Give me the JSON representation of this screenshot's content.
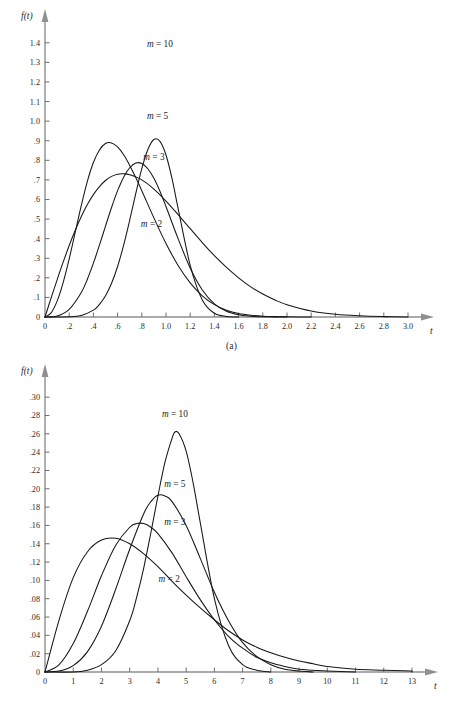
{
  "figure": {
    "panels": [
      {
        "id": "a",
        "caption": "(a)",
        "y_axis_title": "f(t)",
        "x_axis_title": "t",
        "x_ticks": [
          "0",
          ".2",
          ".4",
          ".6",
          ".8",
          "1.0",
          "1.2",
          "1.4",
          "1.6",
          "1.8",
          "2.0",
          "2.2",
          "2.4",
          "2.6",
          "2.8",
          "3.0"
        ],
        "y_ticks": [
          "0",
          ".1",
          ".2",
          ".3",
          ".4",
          ".5",
          ".6",
          ".7",
          ".8",
          ".9",
          "1.0",
          "1.1",
          "1.2",
          "1.3",
          "1.4"
        ],
        "series_labels": [
          "m = 10",
          "m = 5",
          "m = 3",
          "m = 2"
        ]
      },
      {
        "id": "b",
        "caption": "(b)",
        "y_axis_title": "f(t)",
        "x_axis_title": "t",
        "x_ticks": [
          "0",
          "1",
          "2",
          "3",
          "4",
          "5",
          "6",
          "7",
          "8",
          "9",
          "10",
          "11",
          "12",
          "13"
        ],
        "y_ticks": [
          "0",
          ".02",
          ".04",
          ".06",
          ".08",
          ".10",
          ".12",
          ".14",
          ".16",
          ".18",
          ".20",
          ".22",
          ".24",
          ".26",
          ".28",
          ".30"
        ],
        "series_labels": [
          "m = 10",
          "m = 5",
          "m = 3",
          "m = 2"
        ]
      }
    ]
  },
  "chart_data": [
    {
      "type": "line",
      "panel": "a",
      "title": "",
      "xlabel": "t",
      "ylabel": "f(t)",
      "xlim": [
        0,
        3.0
      ],
      "ylim": [
        0,
        1.45
      ],
      "xticks": [
        0,
        0.2,
        0.4,
        0.6,
        0.8,
        1.0,
        1.2,
        1.4,
        1.6,
        1.8,
        2.0,
        2.2,
        2.4,
        2.6,
        2.8,
        3.0
      ],
      "yticks": [
        0,
        0.1,
        0.2,
        0.3,
        0.4,
        0.5,
        0.6,
        0.7,
        0.8,
        0.9,
        1.0,
        1.1,
        1.2,
        1.3,
        1.4
      ],
      "grid": false,
      "legend_position": "inline-annotations",
      "annotations": [
        {
          "text": "m = 10",
          "x": 0.95,
          "y": 1.38
        },
        {
          "text": "m = 5",
          "x": 0.93,
          "y": 1.01
        },
        {
          "text": "m = 3",
          "x": 0.9,
          "y": 0.8
        },
        {
          "text": "m = 2",
          "x": 0.88,
          "y": 0.46
        }
      ],
      "series": [
        {
          "name": "m = 2",
          "peak": {
            "x": 0.52,
            "y": 0.73
          },
          "x": [
            0.0,
            0.05,
            0.1,
            0.15,
            0.2,
            0.25,
            0.3,
            0.35,
            0.4,
            0.45,
            0.5,
            0.55,
            0.6,
            0.65,
            0.7,
            0.8,
            0.9,
            1.0,
            1.1,
            1.2,
            1.3,
            1.4,
            1.5,
            1.6,
            1.7,
            1.8,
            1.9,
            2.0,
            2.2,
            2.4,
            2.6,
            2.8,
            3.0
          ],
          "y": [
            0.0,
            0.096,
            0.19,
            0.28,
            0.365,
            0.443,
            0.513,
            0.574,
            0.625,
            0.666,
            0.697,
            0.718,
            0.729,
            0.731,
            0.726,
            0.7,
            0.653,
            0.592,
            0.523,
            0.451,
            0.38,
            0.313,
            0.253,
            0.2,
            0.154,
            0.117,
            0.087,
            0.063,
            0.031,
            0.014,
            0.006,
            0.002,
            0.0
          ]
        },
        {
          "name": "m = 3",
          "peak": {
            "x": 0.7,
            "y": 0.8
          },
          "x": [
            0.0,
            0.05,
            0.1,
            0.15,
            0.2,
            0.25,
            0.3,
            0.35,
            0.4,
            0.45,
            0.5,
            0.55,
            0.6,
            0.65,
            0.7,
            0.75,
            0.8,
            0.9,
            1.0,
            1.1,
            1.2,
            1.3,
            1.4,
            1.5,
            1.6,
            1.7,
            1.8,
            1.9,
            2.0,
            2.2,
            2.4,
            2.6,
            2.8
          ],
          "y": [
            0.0,
            0.021,
            0.081,
            0.176,
            0.297,
            0.433,
            0.57,
            0.693,
            0.789,
            0.853,
            0.886,
            0.889,
            0.868,
            0.828,
            0.774,
            0.712,
            0.645,
            0.506,
            0.375,
            0.263,
            0.174,
            0.108,
            0.063,
            0.035,
            0.018,
            0.009,
            0.004,
            0.002,
            0.001,
            0.0,
            0.0,
            0.0,
            0.0
          ]
        },
        {
          "name": "m = 5",
          "peak": {
            "x": 0.81,
            "y": 0.97
          },
          "x": [
            0.0,
            0.1,
            0.2,
            0.3,
            0.35,
            0.4,
            0.45,
            0.5,
            0.55,
            0.6,
            0.65,
            0.7,
            0.75,
            0.8,
            0.85,
            0.9,
            0.95,
            1.0,
            1.1,
            1.2,
            1.3,
            1.4,
            1.5,
            1.6,
            1.7,
            1.8,
            2.0,
            2.2,
            2.4
          ],
          "y": [
            0.0,
            0.005,
            0.039,
            0.125,
            0.193,
            0.275,
            0.367,
            0.464,
            0.559,
            0.645,
            0.714,
            0.762,
            0.786,
            0.784,
            0.757,
            0.708,
            0.642,
            0.564,
            0.4,
            0.25,
            0.138,
            0.067,
            0.029,
            0.011,
            0.004,
            0.001,
            0.0,
            0.0,
            0.0
          ]
        },
        {
          "name": "m = 10",
          "peak": {
            "x": 0.92,
            "y": 1.31
          },
          "x": [
            0.0,
            0.2,
            0.3,
            0.4,
            0.45,
            0.5,
            0.55,
            0.6,
            0.65,
            0.7,
            0.75,
            0.8,
            0.85,
            0.9,
            0.95,
            1.0,
            1.05,
            1.1,
            1.2,
            1.3,
            1.4,
            1.5,
            1.6,
            1.7,
            1.8,
            1.9,
            2.0
          ],
          "y": [
            0.0,
            0.001,
            0.008,
            0.035,
            0.064,
            0.108,
            0.172,
            0.258,
            0.367,
            0.494,
            0.63,
            0.757,
            0.855,
            0.906,
            0.897,
            0.827,
            0.706,
            0.555,
            0.264,
            0.087,
            0.019,
            0.003,
            0.0,
            0.0,
            0.0,
            0.0,
            0.0
          ]
        }
      ]
    },
    {
      "type": "line",
      "panel": "b",
      "title": "",
      "xlabel": "t",
      "ylabel": "f(t)",
      "xlim": [
        0,
        13
      ],
      "ylim": [
        0,
        0.31
      ],
      "xticks": [
        0,
        1,
        2,
        3,
        4,
        5,
        6,
        7,
        8,
        9,
        10,
        11,
        12,
        13
      ],
      "yticks": [
        0,
        0.02,
        0.04,
        0.06,
        0.08,
        0.1,
        0.12,
        0.14,
        0.16,
        0.18,
        0.2,
        0.22,
        0.24,
        0.26,
        0.28,
        0.3
      ],
      "grid": false,
      "legend_position": "inline-annotations",
      "annotations": [
        {
          "text": "m = 10",
          "x": 4.6,
          "y": 0.278
        },
        {
          "text": "m = 5",
          "x": 4.6,
          "y": 0.202
        },
        {
          "text": "m = 3",
          "x": 4.6,
          "y": 0.16
        },
        {
          "text": "m = 2",
          "x": 4.4,
          "y": 0.098
        }
      ],
      "series": [
        {
          "name": "m = 2",
          "peak": {
            "x": 2.5,
            "y": 0.146
          },
          "x": [
            0.0,
            0.5,
            1.0,
            1.5,
            2.0,
            2.5,
            3.0,
            3.5,
            4.0,
            4.5,
            5.0,
            5.5,
            6.0,
            6.5,
            7.0,
            7.5,
            8.0,
            8.5,
            9.0,
            9.5,
            10.0,
            11.0,
            12.0,
            13.0
          ],
          "y": [
            0.0,
            0.057,
            0.103,
            0.131,
            0.144,
            0.146,
            0.14,
            0.129,
            0.115,
            0.099,
            0.084,
            0.07,
            0.057,
            0.045,
            0.035,
            0.027,
            0.021,
            0.016,
            0.012,
            0.009,
            0.006,
            0.003,
            0.002,
            0.001
          ]
        },
        {
          "name": "m = 3",
          "peak": {
            "x": 3.45,
            "y": 0.162
          },
          "x": [
            0.0,
            0.5,
            1.0,
            1.5,
            2.0,
            2.5,
            3.0,
            3.25,
            3.5,
            3.75,
            4.0,
            4.5,
            5.0,
            5.5,
            6.0,
            6.5,
            7.0,
            7.5,
            8.0,
            8.5,
            9.0,
            9.5,
            10.0,
            11.0,
            12.0,
            13.0
          ],
          "y": [
            0.0,
            0.008,
            0.031,
            0.066,
            0.105,
            0.138,
            0.158,
            0.162,
            0.162,
            0.158,
            0.151,
            0.13,
            0.104,
            0.079,
            0.057,
            0.039,
            0.026,
            0.016,
            0.01,
            0.006,
            0.003,
            0.002,
            0.001,
            0.0,
            0.0,
            0.0
          ]
        },
        {
          "name": "m = 5",
          "peak": {
            "x": 4.05,
            "y": 0.193
          },
          "x": [
            0.0,
            0.5,
            1.0,
            1.5,
            2.0,
            2.5,
            3.0,
            3.5,
            3.75,
            4.0,
            4.25,
            4.5,
            5.0,
            5.5,
            6.0,
            6.5,
            7.0,
            7.5,
            8.0,
            8.5,
            9.0,
            9.5,
            10.0,
            10.5,
            11.0,
            12.0
          ],
          "y": [
            0.0,
            0.001,
            0.007,
            0.022,
            0.05,
            0.09,
            0.134,
            0.173,
            0.186,
            0.193,
            0.192,
            0.186,
            0.16,
            0.124,
            0.087,
            0.056,
            0.032,
            0.017,
            0.008,
            0.003,
            0.001,
            0.0,
            0.0,
            0.0,
            0.0,
            0.0
          ]
        },
        {
          "name": "m = 10",
          "peak": {
            "x": 4.6,
            "y": 0.262
          },
          "x": [
            0.0,
            1.0,
            1.5,
            2.0,
            2.5,
            3.0,
            3.25,
            3.5,
            3.75,
            4.0,
            4.25,
            4.5,
            4.6,
            4.75,
            5.0,
            5.25,
            5.5,
            6.0,
            6.5,
            7.0,
            7.5,
            8.0,
            8.5,
            9.0,
            9.5,
            10.0
          ],
          "y": [
            0.0,
            0.0,
            0.002,
            0.008,
            0.023,
            0.056,
            0.082,
            0.114,
            0.152,
            0.192,
            0.229,
            0.255,
            0.262,
            0.26,
            0.241,
            0.206,
            0.163,
            0.08,
            0.029,
            0.008,
            0.002,
            0.0,
            0.0,
            0.0,
            0.0,
            0.0
          ]
        }
      ]
    }
  ]
}
